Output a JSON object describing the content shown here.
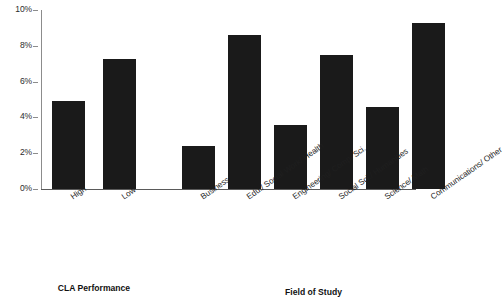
{
  "chart_data": {
    "type": "bar",
    "title": "",
    "xlabel": "",
    "ylabel": "",
    "ylim": [
      0,
      10
    ],
    "grid": false,
    "legend": null,
    "bar_color": "#1a1a1a",
    "axis_color": "#8c8c8c",
    "ytick_labels": [
      "10%",
      "8%",
      "6%",
      "4%",
      "2%",
      "0%"
    ],
    "ytick_values": [
      10,
      8,
      6,
      4,
      2,
      0
    ],
    "categories": [
      "High",
      "Low",
      "Business",
      "Edu./ Social Work/ Health",
      "Engineering/ Comp. Sci.",
      "Social Sci./ Humanities",
      "Science/ Math",
      "Communications/ Other"
    ],
    "values": [
      4.9,
      7.25,
      2.4,
      8.6,
      3.6,
      7.5,
      4.6,
      9.3
    ],
    "groups": [
      {
        "label": "CLA Performance",
        "categories": [
          "High",
          "Low"
        ]
      },
      {
        "label": "Field of Study",
        "categories": [
          "Business",
          "Edu./ Social Work/ Health",
          "Engineering/ Comp. Sci.",
          "Social Sci./ Humanities",
          "Science/ Math",
          "Communications/ Other"
        ]
      }
    ]
  },
  "axis": {
    "ticks": [
      {
        "label": "10%"
      },
      {
        "label": "8%"
      },
      {
        "label": "6%"
      },
      {
        "label": "4%"
      },
      {
        "label": "2%"
      },
      {
        "label": "0%"
      }
    ]
  },
  "bars": [
    {
      "label": "High",
      "value": 4.9
    },
    {
      "label": "Low",
      "value": 7.25
    },
    {
      "label": "Business",
      "value": 2.4
    },
    {
      "label": "Edu./ Social Work/ Health",
      "value": 8.6
    },
    {
      "label": "Engineering/ Comp. Sci.",
      "value": 3.6
    },
    {
      "label": "Social Sci./ Humanities",
      "value": 7.5
    },
    {
      "label": "Science/ Math",
      "value": 4.6
    },
    {
      "label": "Communications/ Other",
      "value": 9.3
    }
  ],
  "groups": [
    {
      "label": "CLA Performance"
    },
    {
      "label": "Field of Study"
    }
  ]
}
